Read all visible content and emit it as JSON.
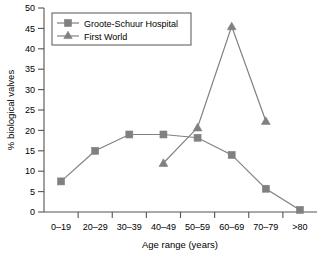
{
  "chart_data": {
    "type": "line",
    "title": "",
    "xlabel": "Age range (years)",
    "ylabel": "% biological valves",
    "categories": [
      "0–19",
      "20–29",
      "30–39",
      "40–49",
      "50–59",
      "60–69",
      "70–79",
      ">80"
    ],
    "ylim": [
      0,
      50
    ],
    "yticks": [
      0,
      5,
      10,
      15,
      20,
      25,
      30,
      35,
      40,
      45,
      50
    ],
    "ytick_labels": [
      "0",
      "5",
      "10",
      "15",
      "20",
      "25",
      "30",
      "35",
      "40",
      "45",
      "50"
    ],
    "grid": false,
    "legend_position": "top-left",
    "series": [
      {
        "name": "Groote-Schuur Hospital",
        "marker": "square",
        "color": "#808080",
        "values": [
          7.5,
          15.0,
          19.0,
          19.0,
          18.2,
          14.0,
          5.7,
          0.5
        ]
      },
      {
        "name": "First World",
        "marker": "triangle",
        "color": "#808080",
        "values": [
          null,
          null,
          null,
          12.0,
          20.7,
          45.5,
          22.3,
          null
        ]
      }
    ]
  },
  "legend": {
    "entries": [
      {
        "label": "Groote-Schuur Hospital",
        "marker": "square"
      },
      {
        "label": "First World",
        "marker": "triangle"
      }
    ]
  },
  "colors": {
    "series": "#808080",
    "axis": "#555555",
    "text": "#000000",
    "background": "#ffffff"
  }
}
